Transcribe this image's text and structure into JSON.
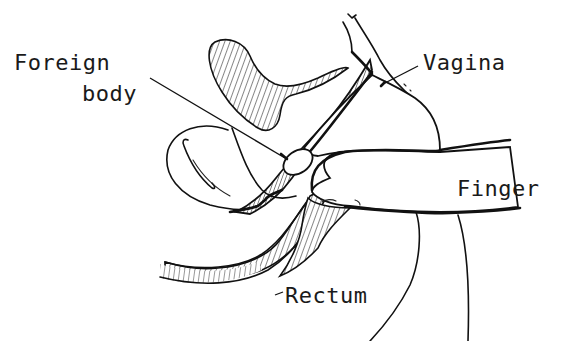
{
  "figure": {
    "type": "anatomical line drawing",
    "labels": {
      "foreign_body_line1": "Foreign",
      "foreign_body_line2": "body",
      "vagina": "Vagina",
      "finger": "Finger",
      "rectum": "Rectum"
    },
    "colors": {
      "ink": "#111111",
      "background": "#ffffff"
    }
  }
}
